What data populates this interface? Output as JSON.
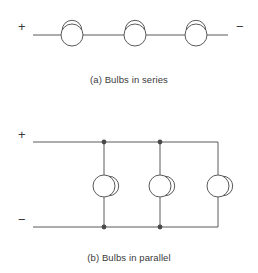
{
  "figure": {
    "background_color": "#ffffff",
    "line_color": "#5a5a5a",
    "text_color": "#3a3a3a",
    "stroke_width": 1
  },
  "series_circuit": {
    "caption": "(a) Bulbs in series",
    "polarity_left": "+",
    "polarity_right": "−",
    "bulb_count": 3,
    "bulb_symbol": "lamp-circle-with-dome-arc",
    "wire": {
      "y": 35,
      "x_start": 33,
      "x_end": 228
    },
    "bulbs": [
      {
        "cx": 72,
        "cy": 35,
        "r": 11
      },
      {
        "cx": 135,
        "cy": 35,
        "r": 11
      },
      {
        "cx": 196,
        "cy": 35,
        "r": 11
      }
    ]
  },
  "parallel_circuit": {
    "caption": "(b) Bulbs in parallel",
    "polarity_top": "+",
    "polarity_bottom": "−",
    "bulb_count": 3,
    "bulb_symbol": "lamp-circle-with-side-arc",
    "top_rail": {
      "y": 142,
      "x_start": 33,
      "x_end": 218
    },
    "bottom_rail": {
      "y": 227,
      "x_start": 33,
      "x_end": 218
    },
    "branches": [
      {
        "x": 104,
        "junction_top": true,
        "junction_bottom": true
      },
      {
        "x": 160,
        "junction_top": true,
        "junction_bottom": true
      },
      {
        "x": 218,
        "junction_top": false,
        "junction_bottom": false
      }
    ],
    "bulbs": [
      {
        "cx": 104,
        "cy": 186,
        "r": 11
      },
      {
        "cx": 160,
        "cy": 186,
        "r": 11
      },
      {
        "cx": 218,
        "cy": 186,
        "r": 11
      }
    ],
    "junction_dot_radius": 2.4
  }
}
